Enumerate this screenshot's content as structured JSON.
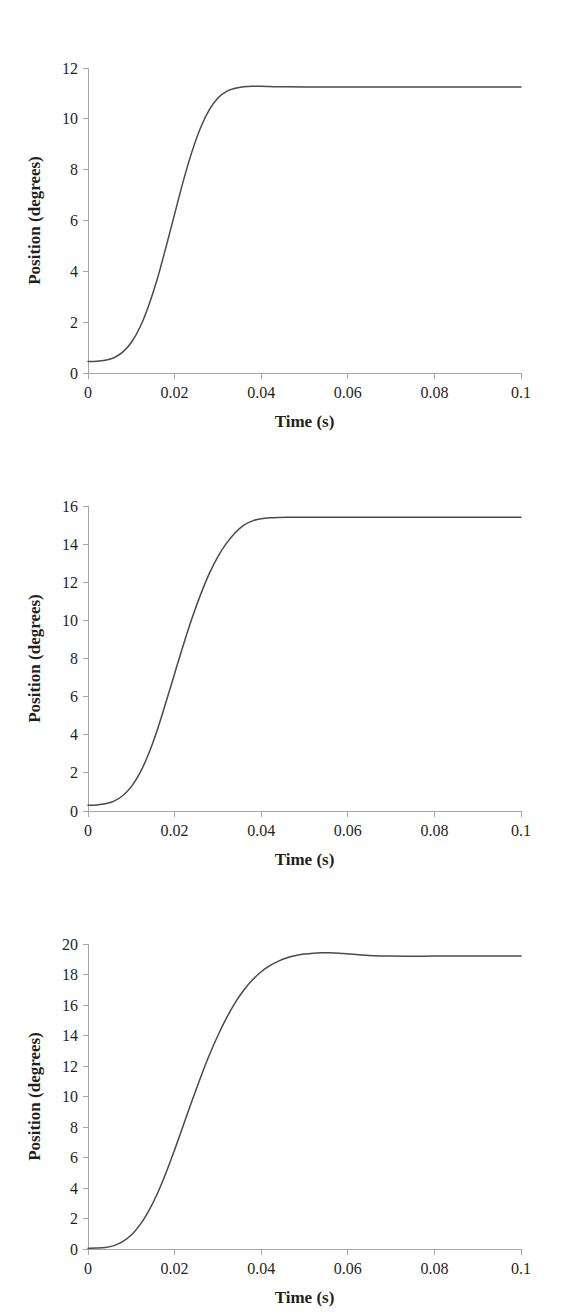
{
  "figure": {
    "panel_count": 3,
    "background_color": "#ffffff",
    "curve_color": "#4a4a4a",
    "axis_color": "#a6a6a6",
    "text_color": "#1f1f1f"
  },
  "chart_data": [
    {
      "type": "line",
      "panel": 1,
      "title": "",
      "xlabel": "Time (s)",
      "ylabel": "Position (degrees)",
      "xlim": [
        0,
        0.1
      ],
      "ylim": [
        0,
        12
      ],
      "grid": false,
      "legend": null,
      "xticks": [
        0,
        0.02,
        0.04,
        0.06,
        0.08,
        0.1
      ],
      "xticklabels": [
        "0",
        "0.02",
        "0.04",
        "0.06",
        "0.08",
        "0.1"
      ],
      "yticks": [
        0,
        2,
        4,
        6,
        8,
        10,
        12
      ],
      "yticklabels": [
        "0",
        "2",
        "4",
        "6",
        "8",
        "10",
        "12"
      ],
      "series": [
        {
          "name": "position",
          "x": [
            0,
            0.002,
            0.004,
            0.006,
            0.008,
            0.01,
            0.012,
            0.014,
            0.016,
            0.018,
            0.02,
            0.022,
            0.024,
            0.026,
            0.028,
            0.03,
            0.032,
            0.034,
            0.036,
            0.038,
            0.04,
            0.042,
            0.044,
            0.046,
            0.05,
            0.055,
            0.06,
            0.065,
            0.07,
            0.075,
            0.08,
            0.085,
            0.09,
            0.095,
            0.1
          ],
          "values": [
            0.45,
            0.46,
            0.5,
            0.6,
            0.82,
            1.2,
            1.8,
            2.65,
            3.7,
            4.95,
            6.25,
            7.55,
            8.7,
            9.65,
            10.35,
            10.82,
            11.08,
            11.2,
            11.26,
            11.28,
            11.28,
            11.27,
            11.26,
            11.26,
            11.25,
            11.25,
            11.25,
            11.25,
            11.25,
            11.25,
            11.25,
            11.25,
            11.25,
            11.25,
            11.25
          ]
        }
      ]
    },
    {
      "type": "line",
      "panel": 2,
      "title": "",
      "xlabel": "Time (s)",
      "ylabel": "Position (degrees)",
      "xlim": [
        0,
        0.1
      ],
      "ylim": [
        0,
        16
      ],
      "grid": false,
      "legend": null,
      "xticks": [
        0,
        0.02,
        0.04,
        0.06,
        0.08,
        0.1
      ],
      "xticklabels": [
        "0",
        "0.02",
        "0.04",
        "0.06",
        "0.08",
        "0.1"
      ],
      "yticks": [
        0,
        2,
        4,
        6,
        8,
        10,
        12,
        14,
        16
      ],
      "yticklabels": [
        "0",
        "2",
        "4",
        "6",
        "8",
        "10",
        "12",
        "14",
        "16"
      ],
      "series": [
        {
          "name": "position",
          "x": [
            0,
            0.002,
            0.004,
            0.006,
            0.008,
            0.01,
            0.012,
            0.014,
            0.016,
            0.018,
            0.02,
            0.022,
            0.024,
            0.026,
            0.028,
            0.03,
            0.032,
            0.034,
            0.036,
            0.038,
            0.04,
            0.042,
            0.044,
            0.046,
            0.048,
            0.05,
            0.055,
            0.06,
            0.065,
            0.07,
            0.075,
            0.08,
            0.085,
            0.09,
            0.095,
            0.1
          ],
          "values": [
            0.3,
            0.32,
            0.38,
            0.52,
            0.8,
            1.28,
            2.0,
            3.0,
            4.25,
            5.7,
            7.2,
            8.7,
            10.1,
            11.35,
            12.45,
            13.35,
            14.05,
            14.6,
            15.0,
            15.22,
            15.33,
            15.38,
            15.4,
            15.41,
            15.41,
            15.41,
            15.41,
            15.41,
            15.41,
            15.41,
            15.41,
            15.41,
            15.41,
            15.41,
            15.41,
            15.41
          ]
        }
      ]
    },
    {
      "type": "line",
      "panel": 3,
      "title": "",
      "xlabel": "Time (s)",
      "ylabel": "Position (degrees)",
      "xlim": [
        0,
        0.1
      ],
      "ylim": [
        0,
        20
      ],
      "grid": false,
      "legend": null,
      "xticks": [
        0,
        0.02,
        0.04,
        0.06,
        0.08,
        0.1
      ],
      "xticklabels": [
        "0",
        "0.02",
        "0.04",
        "0.06",
        "0.08",
        "0.1"
      ],
      "yticks": [
        0,
        2,
        4,
        6,
        8,
        10,
        12,
        14,
        16,
        18,
        20
      ],
      "yticklabels": [
        "0",
        "2",
        "4",
        "6",
        "8",
        "10",
        "12",
        "14",
        "16",
        "18",
        "20"
      ],
      "series": [
        {
          "name": "position",
          "x": [
            0,
            0.002,
            0.004,
            0.006,
            0.008,
            0.01,
            0.012,
            0.014,
            0.016,
            0.018,
            0.02,
            0.022,
            0.024,
            0.026,
            0.028,
            0.03,
            0.032,
            0.034,
            0.036,
            0.038,
            0.04,
            0.042,
            0.044,
            0.046,
            0.048,
            0.05,
            0.052,
            0.054,
            0.056,
            0.058,
            0.06,
            0.063,
            0.066,
            0.07,
            0.075,
            0.08,
            0.085,
            0.09,
            0.095,
            0.1
          ],
          "values": [
            0.05,
            0.06,
            0.1,
            0.22,
            0.48,
            0.92,
            1.58,
            2.48,
            3.62,
            4.98,
            6.5,
            8.1,
            9.7,
            11.25,
            12.7,
            14.0,
            15.15,
            16.15,
            16.98,
            17.65,
            18.18,
            18.58,
            18.88,
            19.1,
            19.25,
            19.34,
            19.4,
            19.43,
            19.43,
            19.4,
            19.35,
            19.28,
            19.23,
            19.21,
            19.2,
            19.21,
            19.21,
            19.22,
            19.22,
            19.22
          ]
        }
      ]
    }
  ]
}
